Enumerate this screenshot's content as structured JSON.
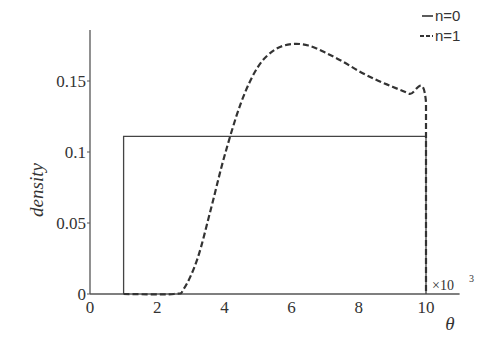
{
  "chart_data": {
    "type": "line",
    "title": "",
    "xlabel": "θ",
    "ylabel": "density",
    "x_scale_note": "×10³",
    "xlim": [
      0,
      11
    ],
    "ylim": [
      0,
      0.185
    ],
    "xticks": [
      "0",
      "2",
      "4",
      "6",
      "8",
      "10"
    ],
    "yticks": [
      "0",
      "0.05",
      "0.1",
      "0.15"
    ],
    "grid": false,
    "legend_position": "top-right",
    "series": [
      {
        "name": "n=0",
        "style": "solid",
        "x": [
          1,
          1,
          10,
          10
        ],
        "y": [
          0,
          0.111,
          0.111,
          0
        ]
      },
      {
        "name": "n=1",
        "style": "dashed",
        "x": [
          1,
          2.5,
          2.8,
          3.2,
          3.6,
          4.0,
          4.5,
          5.0,
          5.5,
          6.0,
          6.5,
          7.0,
          7.5,
          8.0,
          8.5,
          9.0,
          9.5,
          10.0,
          10.0
        ],
        "y": [
          0,
          0,
          0.004,
          0.025,
          0.06,
          0.097,
          0.135,
          0.16,
          0.172,
          0.176,
          0.175,
          0.17,
          0.164,
          0.157,
          0.151,
          0.146,
          0.141,
          0.135,
          0
        ]
      }
    ]
  },
  "legend": {
    "items": [
      {
        "label": "n=0",
        "marker": "—"
      },
      {
        "label": "n=1",
        "marker": "--"
      }
    ]
  },
  "axes": {
    "xlabel": "θ",
    "ylabel": "density",
    "x_multiplier": "×10",
    "x_multiplier_exp": "3"
  }
}
